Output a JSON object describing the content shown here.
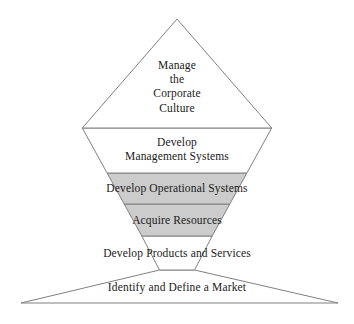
{
  "figure": {
    "name": "business-development-pyramid",
    "shape": "pyramid",
    "tier_count": 6,
    "apex": {
      "x": 177,
      "y": 19
    },
    "base_left": {
      "x": 21,
      "y": 303
    },
    "base_right": {
      "x": 338,
      "y": 303
    },
    "stroke_color": "#808080",
    "background_color": "#ffffff",
    "text_color": "#1a1a1a",
    "shaded_fill": "#cccccc",
    "unshaded_fill": "#ffffff"
  },
  "tiers": [
    {
      "index": 1,
      "label": "Manage\nthe\nCorporate\nCulture",
      "lines": [
        "Manage",
        "the",
        "Corporate",
        "Culture"
      ],
      "shaded": false,
      "fill": "#ffffff",
      "y_top": 19,
      "y_bottom": 128,
      "text_y": 58
    },
    {
      "index": 2,
      "label": "Develop\nManagement Systems",
      "lines": [
        "Develop",
        "Management Systems"
      ],
      "shaded": false,
      "fill": "#ffffff",
      "y_top": 128,
      "y_bottom": 173,
      "text_y": 135
    },
    {
      "index": 3,
      "label": "Develop Operational Systems",
      "lines": [
        "Develop Operational Systems"
      ],
      "shaded": true,
      "fill": "#cccccc",
      "y_top": 173,
      "y_bottom": 204,
      "text_y": 181
    },
    {
      "index": 4,
      "label": "Acquire Resources",
      "lines": [
        "Acquire Resources"
      ],
      "shaded": true,
      "fill": "#cccccc",
      "y_top": 204,
      "y_bottom": 236,
      "text_y": 213
    },
    {
      "index": 5,
      "label": "Develop Products and Services",
      "lines": [
        "Develop Products and Services"
      ],
      "shaded": false,
      "fill": "#ffffff",
      "y_top": 236,
      "y_bottom": 270,
      "text_y": 246
    },
    {
      "index": 6,
      "label": "Identify and Define a Market",
      "lines": [
        "Identify and Define a Market"
      ],
      "shaded": false,
      "fill": "#ffffff",
      "y_top": 270,
      "y_bottom": 303,
      "text_y": 280
    }
  ]
}
